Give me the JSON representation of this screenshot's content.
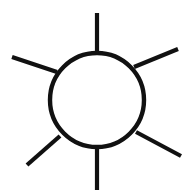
{
  "graphic": {
    "name": "sun-icon",
    "description": "Sun symbol: an open circle with six straight radiating rays",
    "alt_text": "Sun",
    "background_color": "#ffffff",
    "stroke_color": "#111111",
    "fill": "none",
    "canvas": {
      "width": 192,
      "height": 196
    },
    "circle": {
      "name": "sun-disc",
      "center_x": 97,
      "center_y": 100,
      "radius": 47,
      "stroke_width": 4.4
    },
    "ray_count": 6,
    "ray_stroke_width": 4.2,
    "rays": [
      {
        "name": "ray-top",
        "direction": "up",
        "x1": 97,
        "y1": 13,
        "x2": 97,
        "y2": 54
      },
      {
        "name": "ray-top-right",
        "direction": "up-right",
        "x1": 178,
        "y1": 49,
        "x2": 134,
        "y2": 67
      },
      {
        "name": "ray-top-left",
        "direction": "up-left",
        "x1": 12,
        "y1": 57,
        "x2": 57,
        "y2": 72
      },
      {
        "name": "ray-bottom-left",
        "direction": "down-left",
        "x1": 27,
        "y1": 165,
        "x2": 60,
        "y2": 136
      },
      {
        "name": "ray-bottom-right",
        "direction": "down-right",
        "x1": 181,
        "y1": 156,
        "x2": 136,
        "y2": 132
      },
      {
        "name": "ray-bottom",
        "direction": "down",
        "x1": 97,
        "y1": 147,
        "x2": 97,
        "y2": 190
      }
    ]
  }
}
